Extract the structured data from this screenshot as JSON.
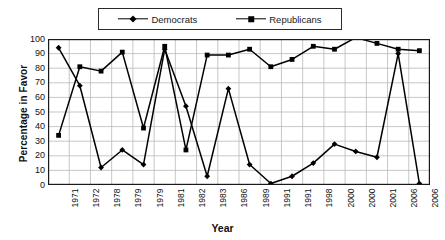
{
  "chart_data": {
    "type": "line",
    "title": "",
    "xlabel": "Year",
    "ylabel": "Percentage in Favor",
    "ylim": [
      0,
      100
    ],
    "ytick_values": [
      0,
      10,
      20,
      30,
      40,
      50,
      60,
      70,
      80,
      90,
      100
    ],
    "grid": true,
    "legend_position": "top-center",
    "categories": [
      "1971",
      "1972",
      "1978",
      "1979",
      "1979",
      "1981",
      "1982",
      "1983",
      "1986",
      "1989",
      "1991",
      "1991",
      "1998",
      "2000",
      "2000",
      "2001",
      "2006",
      "2006"
    ],
    "series": [
      {
        "name": "Democrats",
        "marker": "diamond",
        "color": "#000000",
        "values": [
          94,
          68,
          12,
          24,
          14,
          93,
          54,
          6,
          66,
          14,
          1,
          6,
          15,
          28,
          23,
          19,
          90,
          1
        ]
      },
      {
        "name": "Republicans",
        "marker": "square",
        "color": "#000000",
        "values": [
          34,
          81,
          78,
          91,
          39,
          95,
          24,
          89,
          89,
          93,
          81,
          86,
          95,
          93,
          101,
          97,
          93,
          92
        ]
      }
    ]
  },
  "legend": {
    "entries": [
      {
        "label": "Democrats",
        "marker": "diamond-marker"
      },
      {
        "label": "Republicans",
        "marker": "square-marker"
      }
    ]
  },
  "axes": {
    "y_title": "Percentage in Favor",
    "x_title": "Year"
  },
  "colors": {
    "line": "#000000",
    "grid": "#b9b9b9",
    "axis": "#1a1a1a",
    "background": "#ffffff"
  }
}
